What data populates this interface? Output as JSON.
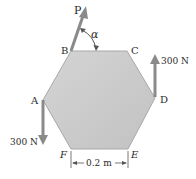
{
  "diagram": {
    "type": "statics-free-body",
    "shape": "regular-hexagon",
    "fill_color": "#c9c9c9",
    "edge_color": "#9a9a9a",
    "arrow_color": "#8a8a8a",
    "vertices": {
      "A": {
        "label": "A",
        "x": 43,
        "y": 100
      },
      "B": {
        "label": "B",
        "x": 71,
        "y": 51
      },
      "C": {
        "label": "C",
        "x": 127,
        "y": 51
      },
      "D": {
        "label": "D",
        "x": 155,
        "y": 97
      },
      "E": {
        "label": "E",
        "x": 128,
        "y": 149
      },
      "F": {
        "label": "F",
        "x": 71,
        "y": 149
      }
    },
    "forces": [
      {
        "name": "P",
        "label": "P",
        "at": "B",
        "direction": "up-right",
        "angle_label": "α"
      },
      {
        "name": "force-D",
        "label": "300 N",
        "at": "D",
        "direction": "up"
      },
      {
        "name": "force-A",
        "label": "300 N",
        "at": "A",
        "direction": "down"
      }
    ],
    "dimension": {
      "label": "0.2 m",
      "from": "F",
      "to": "E"
    }
  }
}
